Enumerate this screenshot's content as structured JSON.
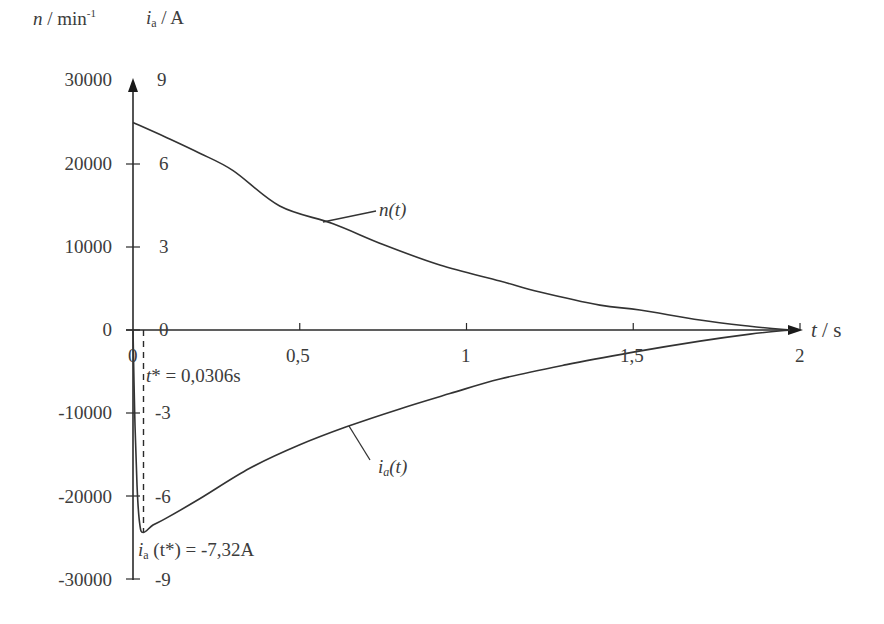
{
  "chart_data": {
    "type": "line",
    "title": "",
    "xlabel": "t / s",
    "ylabel_left": "n / min-1",
    "ylabel_right": "ia / A",
    "x_ticks": [
      "0",
      "0,5",
      "1",
      "1,5",
      "2"
    ],
    "x_tick_values": [
      0,
      0.5,
      1,
      1.5,
      2
    ],
    "y_left_ticks": [
      "30000",
      "20000",
      "10000",
      "0",
      "-10000",
      "-20000",
      "-30000"
    ],
    "y_left_tick_values": [
      30000,
      20000,
      10000,
      0,
      -10000,
      -20000,
      -30000
    ],
    "y_right_ticks": [
      "9",
      "6",
      "3",
      "0",
      "-3",
      "-6",
      "-9"
    ],
    "y_right_tick_values": [
      9,
      6,
      3,
      0,
      -3,
      -6,
      -9
    ],
    "xlim": [
      0,
      2
    ],
    "ylim_left": [
      -30000,
      30000
    ],
    "ylim_right": [
      -9,
      9
    ],
    "grid": false,
    "legend": "inline labels",
    "series": [
      {
        "name": "n(t)",
        "axis": "left",
        "x": [
          0,
          0.1,
          0.2,
          0.3,
          0.44,
          0.6,
          0.75,
          0.92,
          1.1,
          1.22,
          1.4,
          1.52,
          1.7,
          1.85,
          1.97
        ],
        "values": [
          25000,
          23200,
          21300,
          19200,
          14940,
          12800,
          10300,
          7830,
          5900,
          4580,
          3000,
          2410,
          1200,
          450,
          0
        ]
      },
      {
        "name": "ia(t)",
        "axis": "right",
        "x": [
          0,
          0.005,
          0.012,
          0.02,
          0.0306,
          0.06,
          0.1,
          0.2,
          0.35,
          0.5,
          0.64,
          0.8,
          0.95,
          1.1,
          1.3,
          1.5,
          1.7,
          1.85,
          1.97
        ],
        "values": [
          0,
          -3.0,
          -5.6,
          -7.0,
          -7.32,
          -7.05,
          -6.8,
          -6.1,
          -5.0,
          -4.15,
          -3.5,
          -2.85,
          -2.3,
          -1.77,
          -1.25,
          -0.8,
          -0.4,
          -0.15,
          0
        ]
      }
    ],
    "annotations": [
      {
        "text": "t* = 0,0306s",
        "x": 0.0306,
        "note": "dashed vertical line"
      },
      {
        "text": "ia (t*) = -7,32A",
        "x": 0.0306,
        "y": -7.32
      }
    ]
  },
  "labels": {
    "y_left_unit_var": "n",
    "y_left_unit_sep": " / min",
    "y_left_unit_exp": "-1",
    "y_right_var": "i",
    "y_right_sub": "a",
    "y_right_unit": " / A",
    "x_var": "t",
    "x_unit": "/ s",
    "n_curve_label": "n(t)",
    "ia_curve_var": "i",
    "ia_curve_sub": "a",
    "ia_curve_arg": "(t)",
    "tstar_var": "t",
    "tstar_text": "* = 0,0306s",
    "ia_star_var": "i",
    "ia_star_sub": "a",
    "ia_star_text": " (t*) = -7,32A",
    "origin": "0"
  }
}
